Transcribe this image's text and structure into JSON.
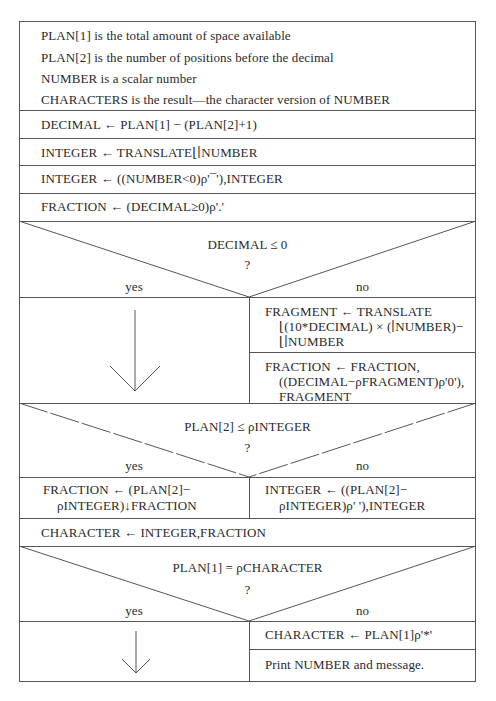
{
  "diagram": {
    "type": "Nassi-Shneiderman structured flowchart",
    "header_lines": [
      "PLAN[1]  is the total amount of space available",
      "PLAN[2]  is the number of positions before the decimal",
      "NUMBER is a scalar number",
      "CHARACTERS is the result—the character version of NUMBER"
    ],
    "steps": [
      "DECIMAL ← PLAN[1] − (PLAN[2]+1)",
      "INTEGER ← TRANSLATE⌊∣NUMBER",
      "INTEGER ← ((NUMBER<0)ρ'¯'),INTEGER",
      "FRACTION ← (DECIMAL≥0)ρ'.'"
    ],
    "decision1": {
      "condition": "DECIMAL ≤ 0",
      "question": "?",
      "yes_label": "yes",
      "no_label": "no",
      "yes_action": "arrow-down",
      "no_actions": [
        [
          "FRAGMENT ← TRANSLATE",
          "⌊(10*DECIMAL) × (∣NUMBER)−",
          "⌊∣NUMBER"
        ],
        [
          "FRACTION ← FRACTION,",
          "((DECIMAL−ρFRAGMENT)ρ'0'),",
          "FRAGMENT"
        ]
      ]
    },
    "decision2": {
      "condition": "PLAN[2] ≤ ρINTEGER",
      "question": "?",
      "yes_label": "yes",
      "no_label": "no",
      "yes_action": [
        "FRACTION ← (PLAN[2]−",
        "ρINTEGER)↓FRACTION"
      ],
      "no_action": [
        "INTEGER ← ((PLAN[2]−",
        "ρINTEGER)ρ' '),INTEGER"
      ]
    },
    "step_after": "CHARACTER ← INTEGER,FRACTION",
    "decision3": {
      "condition": "PLAN[1] = ρCHARACTER",
      "question": "?",
      "yes_label": "yes",
      "no_label": "no",
      "yes_action": "arrow-down",
      "no_actions": [
        "CHARACTER ← PLAN[1]ρ'*'",
        "Print NUMBER and message."
      ]
    },
    "colors": {
      "line": "#555555",
      "text": "#2a2a2a",
      "background": "#ffffff"
    }
  }
}
